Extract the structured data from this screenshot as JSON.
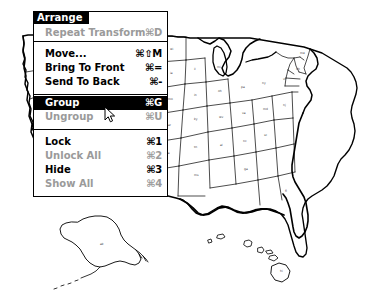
{
  "document": {
    "type": "vector-drawing",
    "subject": "united-states-map",
    "description": "Outline map of the United States with state borders, including Alaska and Hawaii insets"
  },
  "menu": {
    "title": "Arrange",
    "groups": [
      {
        "name": "transform",
        "items": [
          {
            "label": "Repeat Transform",
            "shortcut": "⌘D",
            "state": "disabled",
            "selected": false
          }
        ]
      },
      {
        "name": "ordering",
        "items": [
          {
            "label": "Move...",
            "shortcut": "⌘⇧M",
            "state": "enabled",
            "selected": false
          },
          {
            "label": "Bring To Front",
            "shortcut": "⌘=",
            "state": "enabled",
            "selected": false
          },
          {
            "label": "Send To Back",
            "shortcut": "⌘-",
            "state": "enabled",
            "selected": false
          }
        ]
      },
      {
        "name": "grouping",
        "items": [
          {
            "label": "Group",
            "shortcut": "⌘G",
            "state": "enabled",
            "selected": true
          },
          {
            "label": "Ungroup",
            "shortcut": "⌘U",
            "state": "disabled",
            "selected": false
          }
        ]
      },
      {
        "name": "locking",
        "items": [
          {
            "label": "Lock",
            "shortcut": "⌘1",
            "state": "enabled",
            "selected": false
          },
          {
            "label": "Unlock All",
            "shortcut": "⌘2",
            "state": "disabled",
            "selected": false
          },
          {
            "label": "Hide",
            "shortcut": "⌘3",
            "state": "enabled",
            "selected": false
          },
          {
            "label": "Show All",
            "shortcut": "⌘4",
            "state": "disabled",
            "selected": false
          }
        ]
      }
    ]
  },
  "cursor": {
    "kind": "arrow-pointer",
    "x": 104,
    "y": 106
  },
  "colors": {
    "menu_background": "#ffffff",
    "menu_border": "#000000",
    "highlight_background": "#000000",
    "highlight_text": "#ffffff",
    "enabled_text": "#000000",
    "disabled_text": "#9a9a9a",
    "map_stroke": "#000000",
    "canvas_background": "#ffffff"
  }
}
